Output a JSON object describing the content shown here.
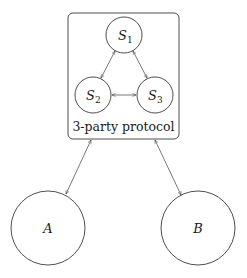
{
  "diagram": {
    "container": {
      "label": "3-party protocol",
      "nodes": [
        {
          "id": "S1",
          "label": "S",
          "subscript": "1"
        },
        {
          "id": "S2",
          "label": "S",
          "subscript": "2"
        },
        {
          "id": "S3",
          "label": "S",
          "subscript": "3"
        }
      ]
    },
    "external_nodes": [
      {
        "id": "A",
        "label": "A"
      },
      {
        "id": "B",
        "label": "B"
      }
    ],
    "edges": [
      {
        "from": "S1",
        "to": "S2",
        "direction": "both"
      },
      {
        "from": "S1",
        "to": "S3",
        "direction": "both"
      },
      {
        "from": "S2",
        "to": "S3",
        "direction": "both"
      },
      {
        "from": "container",
        "to": "A",
        "direction": "both"
      },
      {
        "from": "container",
        "to": "B",
        "direction": "both"
      }
    ]
  }
}
